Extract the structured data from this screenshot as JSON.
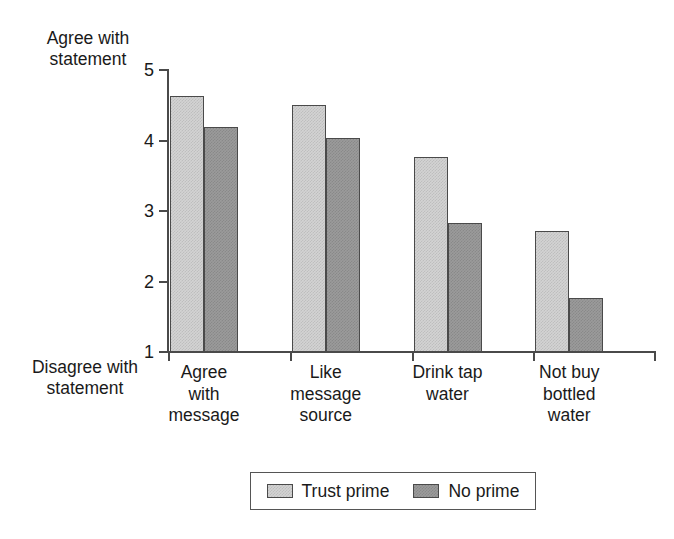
{
  "chart_data": {
    "type": "bar",
    "title": "",
    "xlabel": "",
    "ylabel": "",
    "categories": [
      "Agree\nwith\nmessage",
      "Like\nmessage\nsource",
      "Drink tap\nwater",
      "Not buy\nbottled\nwater"
    ],
    "series": [
      {
        "name": "Trust prime",
        "values": [
          4.63,
          4.51,
          3.76,
          2.72
        ],
        "color": "#d3d3d3"
      },
      {
        "name": "No prime",
        "values": [
          4.19,
          4.03,
          2.83,
          1.76
        ],
        "color": "#9b9b9b"
      }
    ],
    "ylim": [
      1,
      5
    ],
    "yticks": [
      1,
      2,
      3,
      4,
      5
    ],
    "ytick_labels": [
      "1",
      "2",
      "3",
      "4",
      "5"
    ],
    "y_axis_high_caption": "Agree with\nstatement",
    "y_axis_low_caption": "Disagree with\nstatement",
    "grid": false,
    "legend_position": "bottom"
  },
  "legend": {
    "entries": [
      {
        "label": "Trust prime"
      },
      {
        "label": "No prime"
      }
    ]
  }
}
